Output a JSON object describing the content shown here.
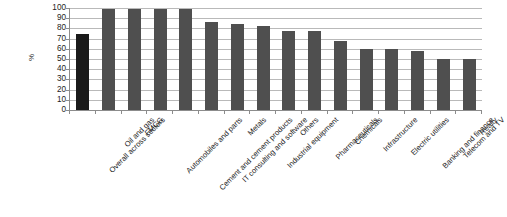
{
  "chart_data": {
    "type": "bar",
    "title": "",
    "subtitle": "",
    "xlabel": "",
    "ylabel": "%",
    "ylim": [
      0,
      100
    ],
    "yticks": [
      0,
      10,
      20,
      30,
      40,
      50,
      60,
      70,
      80,
      90,
      100
    ],
    "grid": true,
    "legend": "none",
    "orientation": "vertical",
    "bar_color": "#4f4f4f",
    "highlight_color": "#1a1a1a",
    "highlight_index": 0,
    "categories": [
      "Overall across sectors",
      "Oil and gas",
      "FMCG",
      "Automobiles and parts",
      "Cement and cement products",
      "IT consulting and software",
      "Metals",
      "Industrial equipment",
      "Others",
      "Pharmaceuticals",
      "Chemicals",
      "Infrastructure",
      "Electric utilities",
      "Banking and finance",
      "Telecom and TV",
      "Realty"
    ],
    "values": [
      75,
      99,
      99,
      99,
      99,
      86,
      84,
      82,
      77,
      77,
      68,
      60,
      60,
      58,
      50,
      50
    ]
  }
}
